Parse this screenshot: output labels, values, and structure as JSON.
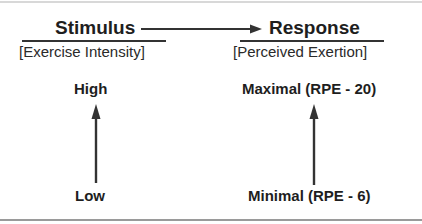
{
  "stimulus": {
    "title": "Stimulus",
    "subtitle": "[Exercise Intensity]",
    "high": "High",
    "low": "Low"
  },
  "response": {
    "title": "Response",
    "subtitle": "[Perceived  Exertion]",
    "high": "Maximal (RPE - 20)",
    "low": "Minimal (RPE - 6)"
  },
  "colors": {
    "text": "#1e1e1e",
    "line": "#333333"
  }
}
